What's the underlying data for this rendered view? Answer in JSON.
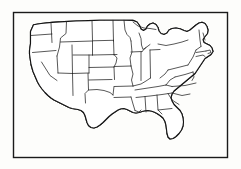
{
  "figure": {
    "style": "line-art-stipple-engraving",
    "caption": "",
    "colors": {
      "background": "#fdfdfb",
      "ink": "#141414",
      "state_border": "#202020",
      "frame": "#1a1a1a",
      "land_fill": "#ffffff",
      "stipple": "#1c1c1c"
    },
    "frame": {
      "visible": true,
      "x": 13,
      "y": 12,
      "width": 215,
      "height": 146
    },
    "map": {
      "region": "Contiguous United States",
      "projection_appearance": "conic",
      "state_borders_visible": true,
      "stipple_fill": true,
      "labels_visible": false,
      "water_features_visible": true,
      "bounds": {
        "left": 30,
        "top": 20,
        "right": 216,
        "bottom": 142
      },
      "landmarks": [
        "Pacific Northwest",
        "Great Lakes",
        "Florida Peninsula",
        "Gulf of Mexico coastline",
        "Atlantic seaboard",
        "Cape Cod",
        "Maine",
        "Great Plains",
        "Texas",
        "Baja California border"
      ]
    }
  }
}
